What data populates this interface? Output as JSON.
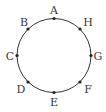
{
  "diagram": {
    "type": "circle-with-labeled-points",
    "circle": {
      "cx": 54,
      "cy": 55.5,
      "r": 37,
      "stroke": "#333333"
    },
    "points": [
      {
        "label": "A",
        "x": 54,
        "y": 18.5,
        "lx": 54,
        "ly": 14,
        "anchor": "middle"
      },
      {
        "label": "H",
        "x": 80,
        "y": 29,
        "lx": 88,
        "ly": 26,
        "anchor": "middle"
      },
      {
        "label": "G",
        "x": 91,
        "y": 55.5,
        "lx": 98,
        "ly": 60,
        "anchor": "middle"
      },
      {
        "label": "F",
        "x": 80,
        "y": 82,
        "lx": 88,
        "ly": 93,
        "anchor": "middle"
      },
      {
        "label": "E",
        "x": 54,
        "y": 92.5,
        "lx": 54,
        "ly": 106,
        "anchor": "middle"
      },
      {
        "label": "D",
        "x": 28,
        "y": 82,
        "lx": 21,
        "ly": 93,
        "anchor": "middle"
      },
      {
        "label": "C",
        "x": 17,
        "y": 55.5,
        "lx": 10,
        "ly": 60,
        "anchor": "middle"
      },
      {
        "label": "B",
        "x": 28,
        "y": 29,
        "lx": 24,
        "ly": 26,
        "anchor": "middle"
      }
    ],
    "colors": {
      "stroke": "#333333",
      "point": "#222222",
      "label": "#3a3a3a"
    }
  }
}
